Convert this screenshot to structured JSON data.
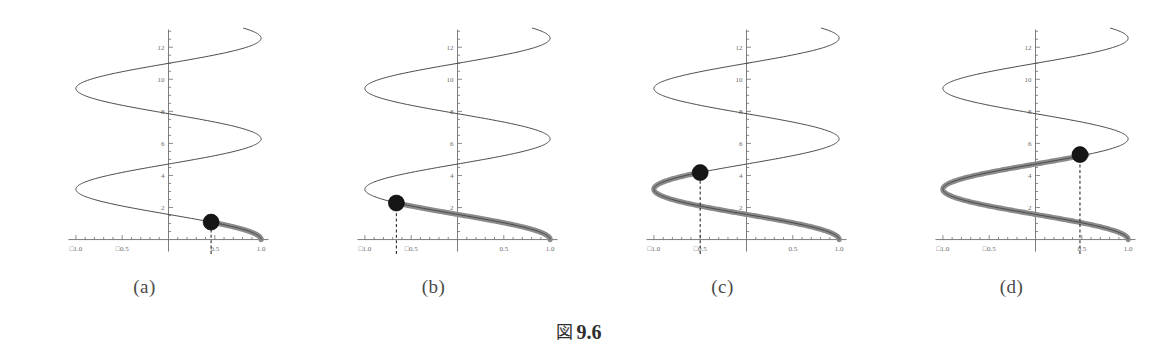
{
  "figure": {
    "caption_prefix": "図",
    "caption_number": "9.6",
    "caption_full": "図 9.6"
  },
  "panels": [
    {
      "id": "a",
      "label": "(a)",
      "marker_x": 0.46,
      "marker_y": 1.09,
      "trace_end_y": 1.09,
      "dashed_guide": true
    },
    {
      "id": "b",
      "label": "(b)",
      "marker_x": -0.66,
      "marker_y": 2.28,
      "trace_end_y": 2.28,
      "dashed_guide": true
    },
    {
      "id": "c",
      "label": "(c)",
      "marker_x": -0.5,
      "marker_y": 4.18,
      "trace_end_y": 4.18,
      "dashed_guide": true
    },
    {
      "id": "d",
      "label": "(d)",
      "marker_x": 0.48,
      "marker_y": 5.3,
      "trace_end_y": 5.3,
      "dashed_guide": true
    }
  ],
  "chart_data": {
    "type": "line",
    "xlabel": "",
    "ylabel": "",
    "xlim": [
      -1.15,
      1.15
    ],
    "ylim": [
      -0.9,
      13.2
    ],
    "grid": false,
    "legend": "none",
    "x_ticks_major": [
      -1.0,
      -0.5,
      0.5,
      1.0
    ],
    "x_tick_labels": [
      "□1.0",
      "□0.5",
      "0.5",
      "1.0"
    ],
    "x_tick_labels_intended": [
      "-1.0",
      "-0.5",
      "0.5",
      "1.0"
    ],
    "y_ticks_major": [
      2,
      4,
      6,
      8,
      10,
      12
    ],
    "y_tick_labels": [
      "2",
      "4",
      "6",
      "8",
      "10",
      "12"
    ],
    "minor_ticks_per_major": 5,
    "curve_description": "x = cos(y), y from 0 to 13.2 (sideways cosine / spiral staircase)",
    "curve_param": {
      "x_expr": "cos(y)",
      "y_min": 0,
      "y_max": 13.2,
      "samples": 420
    },
    "series": [
      {
        "name": "full-curve-thin",
        "style": "thin",
        "color": "#4a4a4a",
        "y_range": [
          0,
          13.2
        ]
      },
      {
        "name": "traced-segment-panel-a",
        "style": "thick",
        "color": "#8a8a8a",
        "y_range": [
          0,
          1.09
        ],
        "panel": "a"
      },
      {
        "name": "traced-segment-panel-b",
        "style": "thick",
        "color": "#8a8a8a",
        "y_range": [
          0,
          2.28
        ],
        "panel": "b"
      },
      {
        "name": "traced-segment-panel-c",
        "style": "thick",
        "color": "#8a8a8a",
        "y_range": [
          0,
          4.18
        ],
        "panel": "c"
      },
      {
        "name": "traced-segment-panel-d",
        "style": "thick",
        "color": "#8a8a8a",
        "y_range": [
          0,
          5.3
        ],
        "panel": "d"
      }
    ],
    "markers": [
      {
        "panel": "a",
        "x": 0.46,
        "y": 1.09,
        "color": "#161616",
        "radius_px": 8
      },
      {
        "panel": "b",
        "x": -0.66,
        "y": 2.28,
        "color": "#161616",
        "radius_px": 8
      },
      {
        "panel": "c",
        "x": -0.5,
        "y": 4.18,
        "color": "#161616",
        "radius_px": 8
      },
      {
        "panel": "d",
        "x": 0.48,
        "y": 5.3,
        "color": "#161616",
        "radius_px": 8
      }
    ],
    "annotations": [
      {
        "panel": "a",
        "type": "dashed-vertical",
        "x": 0.46,
        "from_y": -0.9,
        "to_y": 1.09
      },
      {
        "panel": "b",
        "type": "dashed-vertical",
        "x": -0.66,
        "from_y": -0.9,
        "to_y": 2.28
      },
      {
        "panel": "c",
        "type": "dashed-vertical",
        "x": -0.5,
        "from_y": -0.9,
        "to_y": 4.18
      },
      {
        "panel": "d",
        "type": "dashed-vertical",
        "x": 0.48,
        "from_y": -0.9,
        "to_y": 5.3
      }
    ],
    "panel_labels": [
      "(a)",
      "(b)",
      "(c)",
      "(d)"
    ],
    "colors": {
      "background": "#ffffff",
      "axis": "#6e6e6e",
      "thin_curve": "#4a4a4a",
      "thick_curve": "#8a8a8a",
      "marker": "#161616",
      "tick_label": "#6b6b6b",
      "caption": "#2e2e2e"
    }
  }
}
